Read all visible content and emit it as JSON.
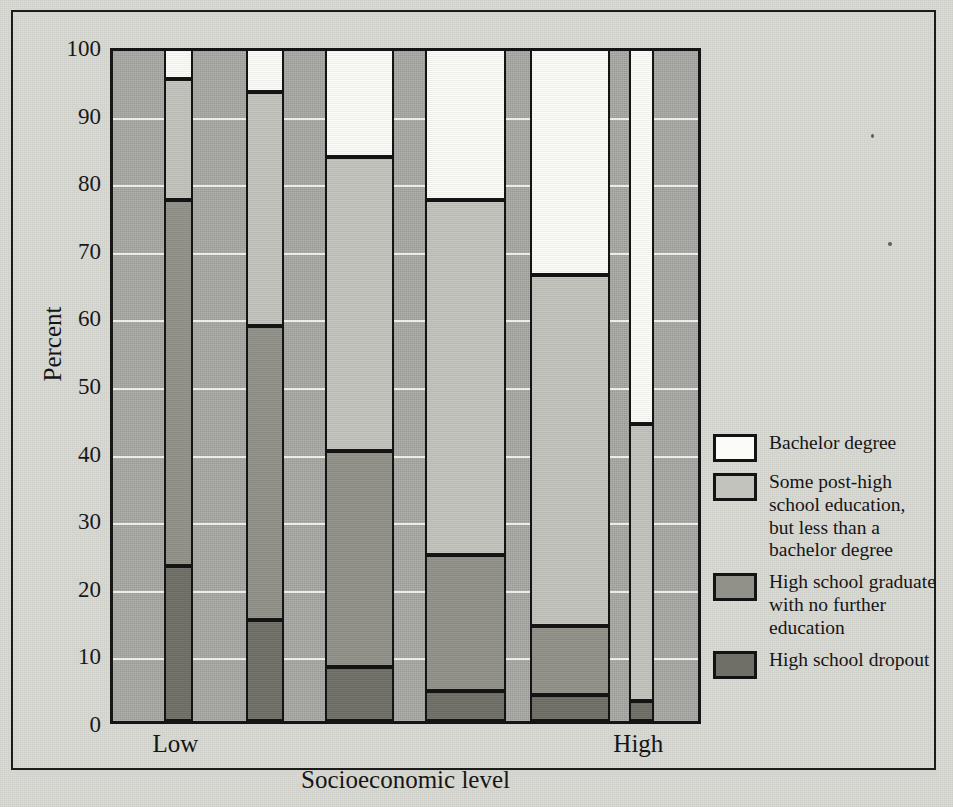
{
  "chart_data": {
    "type": "bar",
    "subtype": "stacked-percentage",
    "title": "",
    "xlabel": "Socioeconomic level",
    "ylabel": "Percent",
    "ylim": [
      0,
      100
    ],
    "ytick_values": [
      0,
      10,
      20,
      30,
      40,
      50,
      60,
      70,
      80,
      90,
      100
    ],
    "ytick_labels": [
      "0",
      "10",
      "20",
      "30",
      "40",
      "50",
      "60",
      "70",
      "80",
      "90",
      "100"
    ],
    "grid": true,
    "grid_axis": "y",
    "legend_position": "right",
    "categories": [
      "Low",
      "",
      "",
      "",
      "",
      "High"
    ],
    "xtick_labels_shown": [
      "Low",
      "High"
    ],
    "series": [
      {
        "name": "Bachelor degree",
        "color": "#fbfbf8",
        "values": [
          5.0,
          7.0,
          16.5,
          23.0,
          34.0,
          56.0
        ]
      },
      {
        "name": "Some post-high school education, but less than a bachelor degree",
        "color": "#c3c3bd",
        "values": [
          18.0,
          34.5,
          43.5,
          52.5,
          52.0,
          41.0
        ]
      },
      {
        "name": "High school graduate with no further education",
        "color": "#919189",
        "values": [
          54.0,
          43.5,
          32.0,
          20.0,
          10.2,
          0.0
        ]
      },
      {
        "name": "High school dropout",
        "color": "#6f6f68",
        "values": [
          23.0,
          15.0,
          8.0,
          4.5,
          3.8,
          3.0
        ]
      }
    ],
    "cumulative_tops": {
      "bar1": {
        "dropout": 23.0,
        "grad": 77.0,
        "some": 95.0,
        "bachelor": 100
      },
      "bar2": {
        "dropout": 15.0,
        "grad": 58.5,
        "some": 93.0,
        "bachelor": 100
      },
      "bar3": {
        "dropout": 8.0,
        "grad": 40.0,
        "some": 83.5,
        "bachelor": 100
      },
      "bar4": {
        "dropout": 4.5,
        "grad": 24.5,
        "some": 77.0,
        "bachelor": 100
      },
      "bar5": {
        "dropout": 3.8,
        "grad": 14.0,
        "some": 66.0,
        "bachelor": 100
      },
      "bar6": {
        "dropout": 3.0,
        "grad": 3.0,
        "some": 44.0,
        "bachelor": 100
      }
    },
    "bar_geometry": [
      {
        "left_pct": 8.6,
        "width_pct": 4.9
      },
      {
        "left_pct": 22.5,
        "width_pct": 6.4
      },
      {
        "left_pct": 35.9,
        "width_pct": 11.7
      },
      {
        "left_pct": 52.8,
        "width_pct": 13.7
      },
      {
        "left_pct": 70.6,
        "width_pct": 13.5
      },
      {
        "left_pct": 87.3,
        "width_pct": 4.2
      }
    ]
  },
  "axes": {
    "y_label": "Percent",
    "x_label": "Socioeconomic level",
    "y_ticks": [
      "100",
      "90",
      "80",
      "70",
      "60",
      "50",
      "40",
      "30",
      "20",
      "10",
      "0"
    ],
    "x_tick_low": "Low",
    "x_tick_high": "High"
  },
  "legend": {
    "items": [
      {
        "name": "bachelor-degree",
        "swatch_class": "sw-bachelor",
        "lines": [
          "Bachelor degree"
        ]
      },
      {
        "name": "some-post-high-school",
        "swatch_class": "sw-some",
        "lines": [
          "Some post-high",
          "school education,",
          "but less than a",
          "bachelor degree"
        ]
      },
      {
        "name": "high-school-graduate",
        "swatch_class": "sw-grad",
        "lines": [
          "High school graduate",
          "with no further",
          "education"
        ]
      },
      {
        "name": "high-school-dropout",
        "swatch_class": "sw-dropout",
        "lines": [
          "High school dropout"
        ]
      }
    ]
  },
  "colors": {
    "bachelor": "#fbfbf8",
    "some_post_high": "#c3c3bd",
    "hs_graduate": "#919189",
    "hs_dropout": "#6f6f68",
    "plot_background": "#a9a9a4",
    "page_background": "#d9d9d4",
    "gridline": "#f2f2ef",
    "ink": "#151515"
  }
}
